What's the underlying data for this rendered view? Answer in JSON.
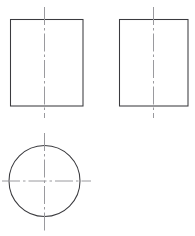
{
  "document": {
    "title": "Orthographic Projection Drawing",
    "drawing_type": "third-angle orthographic projection",
    "background_color": "#ffffff",
    "outline_color": "#3b3b3f",
    "centerline_color": "#9a9a9e",
    "canvas": {
      "width": 195,
      "height": 236
    }
  },
  "views": [
    {
      "id": "front-view",
      "label": "Front View",
      "shape": "rectangle",
      "x": 10.5,
      "y": 19.5,
      "width": 72.5,
      "height": 86.5,
      "centerlines": [
        {
          "id": "front-view-vertical-centerline",
          "orientation": "vertical",
          "x": 44.5,
          "y1": 7,
          "y2": 118,
          "dash_pattern": "18,3,2.5,3"
        }
      ]
    },
    {
      "id": "side-view",
      "label": "Side View",
      "shape": "rectangle",
      "x": 119.5,
      "y": 19.5,
      "width": 68.5,
      "height": 86.5,
      "centerlines": [
        {
          "id": "side-view-vertical-centerline",
          "orientation": "vertical",
          "x": 153.5,
          "y1": 7,
          "y2": 118,
          "dash_pattern": "18,3,2.5,3"
        }
      ]
    },
    {
      "id": "top-view",
      "label": "Top View",
      "shape": "circle",
      "cx": 44.5,
      "cy": 181,
      "r": 35.5,
      "centerlines": [
        {
          "id": "top-view-vertical-centerline",
          "orientation": "vertical",
          "x": 44.5,
          "y1": 133,
          "y2": 231,
          "dash_pattern": "18,3,2.5,3"
        },
        {
          "id": "top-view-horizontal-centerline",
          "orientation": "horizontal",
          "y": 181,
          "x1": 2,
          "x2": 91,
          "dash_pattern": "18,3,2.5,3"
        }
      ]
    }
  ]
}
